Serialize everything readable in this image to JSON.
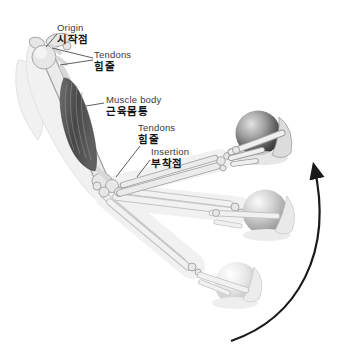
{
  "figure": {
    "labels": {
      "origin": {
        "en": "Origin",
        "ko": "시작점"
      },
      "tendons_upper": {
        "en": "Tendons",
        "ko": "힘줄"
      },
      "muscle_body": {
        "en": "Muscle body",
        "ko": "근육몸통"
      },
      "tendons_lower": {
        "en": "Tendons",
        "ko": "힘줄"
      },
      "insertion": {
        "en": "Insertion",
        "ko": "부착점"
      }
    },
    "colors": {
      "background": "#ffffff",
      "muscle_dark": "#4a4a4a",
      "bone_fill": "#e7e7e7",
      "bone_outline": "#a8a8a8",
      "ghost": "#f1f1f1",
      "pointer_line": "#4d4d4d",
      "arrow": "#1a1a1a",
      "label_en_text": "#3a3a3a",
      "label_ko_text": "#141414",
      "ball_top_shade": "#2c2c2c",
      "ball_middle_shade": "#8a8a8a",
      "ball_bottom_shade": "#b2b2b2"
    }
  }
}
